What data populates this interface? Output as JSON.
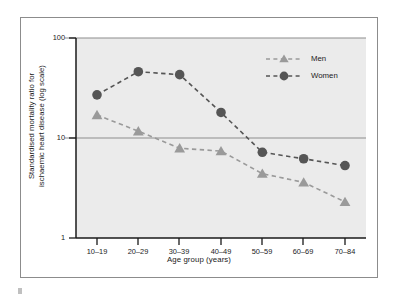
{
  "figure": {
    "background_color": "#ffffff",
    "frame_border_color": "#8c8c8c",
    "plot_background_color": "#ebebeb"
  },
  "chart_data": {
    "type": "line",
    "title": "",
    "subtitle": "",
    "xlabel": "Age group (years)",
    "ylabel": "Standardised mortality ratio for ischaemic heart disease (log scale)",
    "ylabel_line1": "Standardised mortality ratio for",
    "ylabel_line2": "ischaemic heart disease (log scale)",
    "categories": [
      "10–19",
      "20–29",
      "30–39",
      "40–49",
      "50–59",
      "60–69",
      "70–84"
    ],
    "yscale": "log",
    "ylim": [
      1,
      100
    ],
    "yticks": [
      1,
      10,
      100
    ],
    "ytick_labels": [
      "1",
      "10",
      "100"
    ],
    "grid": "horizontal",
    "legend_position": "top-right",
    "series": [
      {
        "name": "Men",
        "marker": "triangle",
        "color": "#9a9a9a",
        "line_style": "dashed",
        "values": [
          17.0,
          11.7,
          7.9,
          7.4,
          4.4,
          3.6,
          2.3
        ]
      },
      {
        "name": "Women",
        "marker": "circle",
        "color": "#555555",
        "line_style": "dashed",
        "values": [
          27.0,
          46.0,
          43.0,
          18.0,
          7.2,
          6.2,
          5.3
        ]
      }
    ]
  },
  "legend": {
    "entries": [
      {
        "label": "Men"
      },
      {
        "label": "Women"
      }
    ]
  }
}
